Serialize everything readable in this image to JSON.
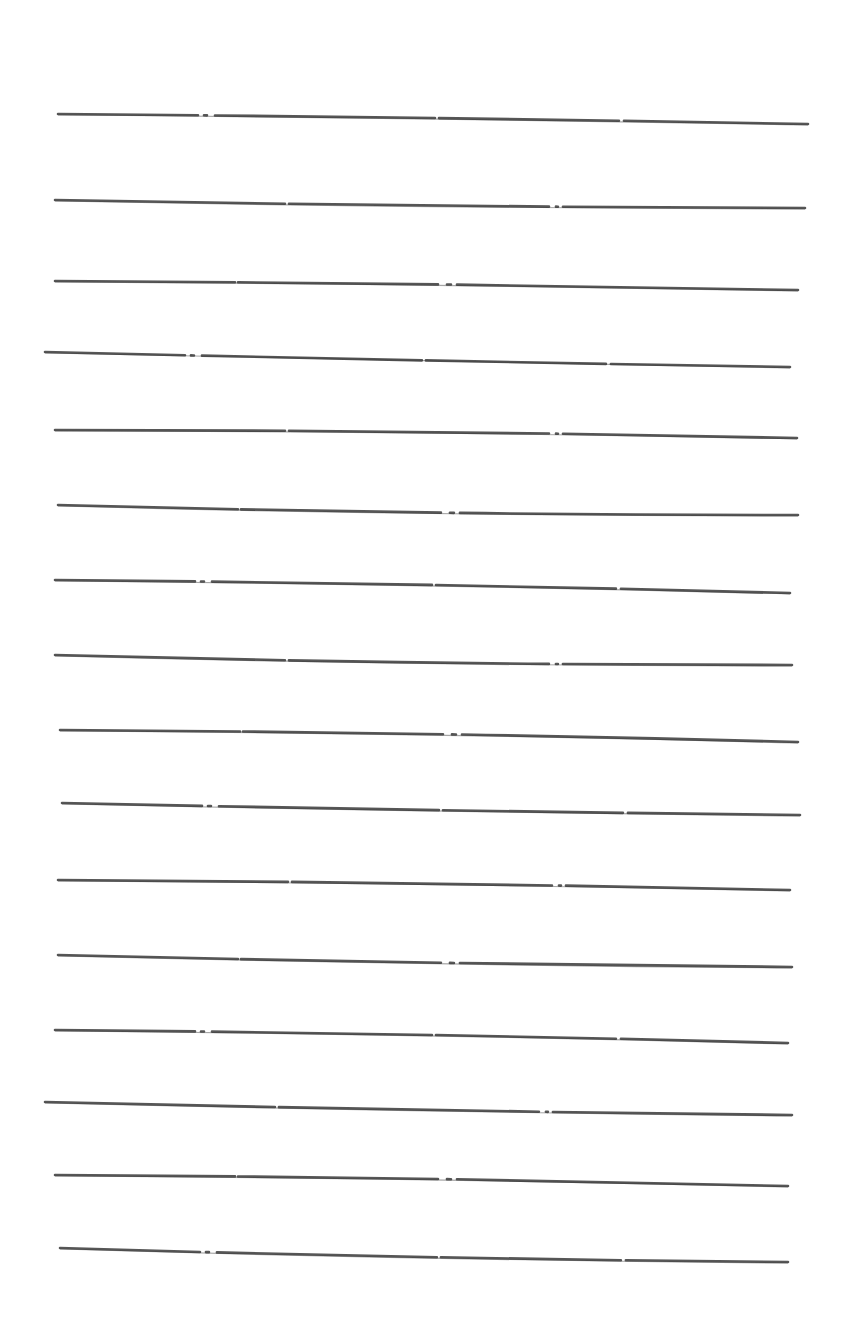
{
  "page": {
    "background": "#ffffff",
    "stroke_color": "#3a3a3a"
  },
  "lines": [
    {
      "x1": 58,
      "y1": 114,
      "x2": 808,
      "y2": 124,
      "mid_y": 120
    },
    {
      "x1": 55,
      "y1": 200,
      "x2": 805,
      "y2": 208,
      "mid_y": 204
    },
    {
      "x1": 55,
      "y1": 281,
      "x2": 798,
      "y2": 290,
      "mid_y": 286
    },
    {
      "x1": 45,
      "y1": 352,
      "x2": 790,
      "y2": 367,
      "mid_y": 358
    },
    {
      "x1": 55,
      "y1": 430,
      "x2": 797,
      "y2": 438,
      "mid_y": 433
    },
    {
      "x1": 58,
      "y1": 505,
      "x2": 798,
      "y2": 515,
      "mid_y": 512
    },
    {
      "x1": 55,
      "y1": 580,
      "x2": 790,
      "y2": 593,
      "mid_y": 586
    },
    {
      "x1": 55,
      "y1": 655,
      "x2": 792,
      "y2": 665,
      "mid_y": 662
    },
    {
      "x1": 60,
      "y1": 730,
      "x2": 798,
      "y2": 742,
      "mid_y": 735
    },
    {
      "x1": 62,
      "y1": 803,
      "x2": 800,
      "y2": 815,
      "mid_y": 808
    },
    {
      "x1": 58,
      "y1": 880,
      "x2": 790,
      "y2": 890,
      "mid_y": 885
    },
    {
      "x1": 58,
      "y1": 955,
      "x2": 792,
      "y2": 967,
      "mid_y": 961
    },
    {
      "x1": 55,
      "y1": 1030,
      "x2": 788,
      "y2": 1043,
      "mid_y": 1036
    },
    {
      "x1": 45,
      "y1": 1102,
      "x2": 792,
      "y2": 1115,
      "mid_y": 1108
    },
    {
      "x1": 55,
      "y1": 1175,
      "x2": 788,
      "y2": 1186,
      "mid_y": 1180
    },
    {
      "x1": 60,
      "y1": 1248,
      "x2": 788,
      "y2": 1262,
      "mid_y": 1256
    }
  ]
}
